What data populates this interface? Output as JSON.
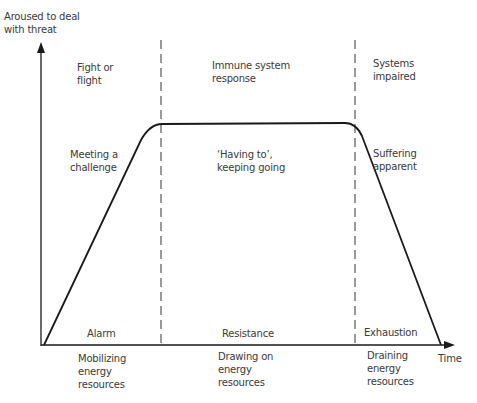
{
  "axes": {
    "y_label": "Aroused to deal\nwith threat",
    "x_label": "Time"
  },
  "phases": [
    {
      "name": "Alarm",
      "top_label": "Fight or\nflight",
      "curve_label": "Meeting a\nchallenge",
      "bottom_label": "Mobilizing\nenergy\nresources"
    },
    {
      "name": "Resistance",
      "top_label": "Immune system\nresponse",
      "curve_label": "‘Having to’,\nkeeping going",
      "bottom_label": "Drawing on\nenergy\nresources"
    },
    {
      "name": "Exhaustion",
      "top_label": "Systems\nimpaired",
      "curve_label": "Suffering\napparent",
      "bottom_label": "Draining\nenergy\nresources"
    }
  ],
  "colors": {
    "line": "#1a1a1a",
    "text": "#3a3a3a",
    "background": "#ffffff"
  }
}
